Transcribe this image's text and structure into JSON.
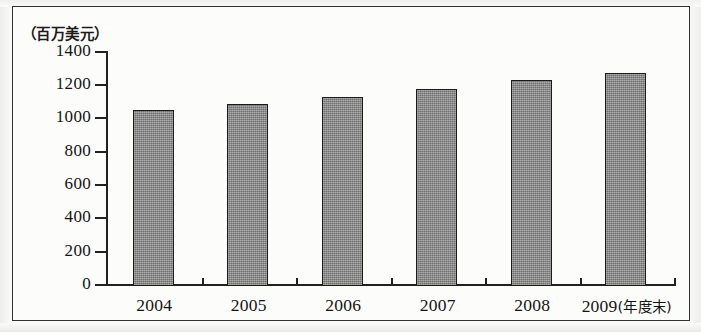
{
  "chart_data": {
    "type": "bar",
    "title": "",
    "subtitle": "",
    "unit_caption": "（百万美元）",
    "xlabel": "",
    "ylabel": "百万美元",
    "categories": [
      "2004",
      "2005",
      "2006",
      "2007",
      "2008",
      "2009"
    ],
    "category_labels": [
      "2004",
      "2005",
      "2006",
      "2007",
      "2008",
      "2009(年度末)"
    ],
    "last_category_suffix": "(年度末)",
    "values": [
      1050,
      1085,
      1130,
      1175,
      1230,
      1270
    ],
    "ylim": [
      0,
      1400
    ],
    "y_ticks": [
      0,
      200,
      400,
      600,
      800,
      1000,
      1200,
      1400
    ],
    "y_tick_labels": [
      "0",
      "200",
      "400",
      "600",
      "800",
      "1000",
      "1200",
      "1400"
    ],
    "grid": false,
    "legend": null,
    "bar_color": "#8b8b8b",
    "bar_border_color": "#1b1a19",
    "axis_color": "#232120",
    "background_color": "#fcfcfb"
  },
  "figure": {
    "frame_border_color": "#33312f"
  }
}
